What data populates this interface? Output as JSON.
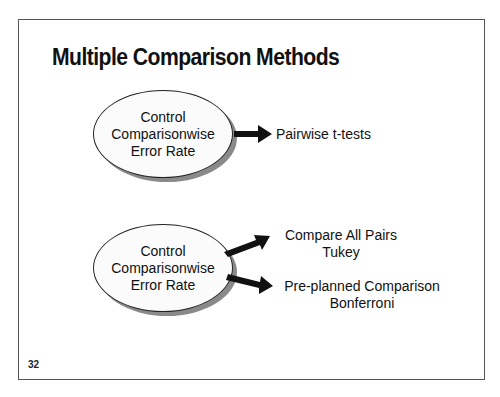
{
  "slide": {
    "title": "Multiple Comparison Methods",
    "page_number": "32"
  },
  "diagram": {
    "groups": [
      {
        "node": {
          "lines": [
            "Control",
            "Comparisonwise",
            "Error Rate"
          ]
        },
        "targets": [
          {
            "lines": [
              "Pairwise t-tests"
            ]
          }
        ]
      },
      {
        "node": {
          "lines": [
            "Control",
            "Comparisonwise",
            "Error Rate"
          ]
        },
        "targets": [
          {
            "lines": [
              "Compare All Pairs",
              "Tukey"
            ]
          },
          {
            "lines": [
              "Pre-planned Comparison",
              "Bonferroni"
            ]
          }
        ]
      }
    ],
    "colors": {
      "border": "#555555",
      "ellipse_fill": "#fbfbfb",
      "shadow": "#8a8a8a",
      "arrow": "#111111"
    }
  }
}
